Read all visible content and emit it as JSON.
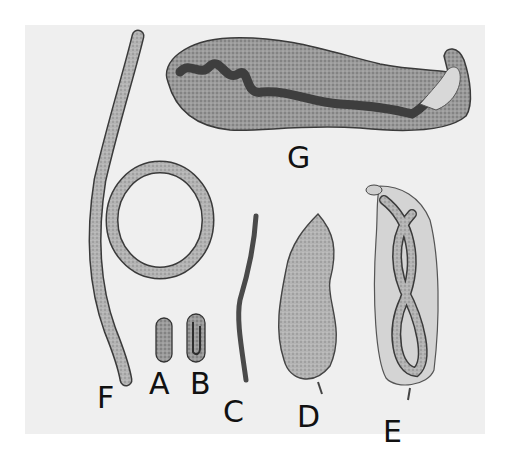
{
  "figure": {
    "background_color": "#efefef",
    "page_color": "#ffffff",
    "ink_color": "#3a3a3a",
    "labels": {
      "A": "A",
      "B": "B",
      "C": "C",
      "D": "D",
      "E": "E",
      "F": "F",
      "G": "G"
    },
    "specimens": [
      {
        "label": "A",
        "depiction": "oval egg, plain"
      },
      {
        "label": "B",
        "depiction": "oval egg containing coiled larva"
      },
      {
        "label": "C",
        "depiction": "slender larva"
      },
      {
        "label": "D",
        "depiction": "bean-shaped larva body with granular interior"
      },
      {
        "label": "E",
        "depiction": "coiled worm within enclosing sheath"
      },
      {
        "label": "F",
        "depiction": "long worm with loop coil"
      },
      {
        "label": "G",
        "depiction": "large elongated swollen female with dark internal tract"
      }
    ]
  }
}
